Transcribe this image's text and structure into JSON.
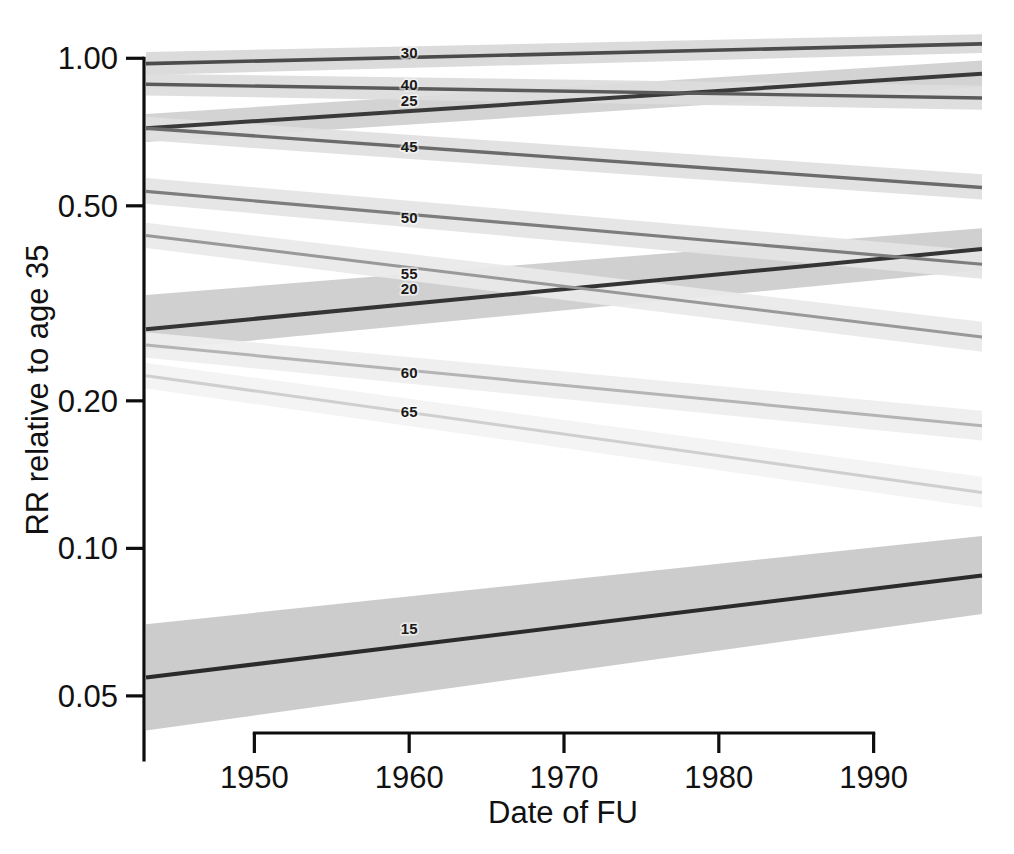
{
  "chart_data": {
    "type": "line",
    "title": "",
    "subtitle": "",
    "xlabel": "Date of FU",
    "ylabel": "RR relative to age 35",
    "yscale": "log",
    "xscale": "linear",
    "grid": false,
    "legend": "inline-labels",
    "xlim": [
      1943,
      1997
    ],
    "ylim": [
      0.042,
      1.1
    ],
    "xticks": [
      1950,
      1960,
      1970,
      1980,
      1990
    ],
    "xtick_labels": [
      "1950",
      "1960",
      "1970",
      "1980",
      "1990"
    ],
    "yticks": [
      0.05,
      0.1,
      0.2,
      0.5,
      1.0
    ],
    "ytick_labels": [
      "0.05",
      "0.10",
      "0.20",
      "0.50",
      "1.00"
    ],
    "x": [
      1943,
      1997
    ],
    "series": [
      {
        "name": "15",
        "label": "15",
        "label_x": 1960,
        "color": "#2b2b2b",
        "width": 4.0,
        "values": [
          0.0545,
          0.088
        ],
        "ci_lower": [
          0.0425,
          0.0735
        ],
        "ci_upper": [
          0.07,
          0.106
        ],
        "band_color": "#c8c8c8"
      },
      {
        "name": "20",
        "label": "20",
        "label_x": 1960,
        "color": "#343434",
        "width": 4.0,
        "values": [
          0.28,
          0.408
        ],
        "ci_lower": [
          0.253,
          0.37
        ],
        "ci_upper": [
          0.329,
          0.45
        ],
        "band_color": "#cccccc"
      },
      {
        "name": "25",
        "label": "25",
        "label_x": 1960,
        "color": "#3a3a3a",
        "width": 4.0,
        "values": [
          0.72,
          0.93
        ],
        "ci_lower": [
          0.675,
          0.875
        ],
        "ci_upper": [
          0.77,
          0.99
        ],
        "band_color": "#cfcfcf"
      },
      {
        "name": "30",
        "label": "30",
        "label_x": 1960,
        "color": "#4b4b4b",
        "width": 3.6,
        "values": [
          0.975,
          1.07
        ],
        "ci_lower": [
          0.925,
          1.025
        ],
        "ci_upper": [
          1.03,
          1.12
        ],
        "band_color": "#d8d8d8"
      },
      {
        "name": "40",
        "label": "40",
        "label_x": 1960,
        "color": "#5a5a5a",
        "width": 3.4,
        "values": [
          0.885,
          0.83
        ],
        "ci_lower": [
          0.84,
          0.785
        ],
        "ci_upper": [
          0.93,
          0.88
        ],
        "band_color": "#dcdcdc"
      },
      {
        "name": "45",
        "label": "45",
        "label_x": 1960,
        "color": "#6b6b6b",
        "width": 3.4,
        "values": [
          0.72,
          0.545
        ],
        "ci_lower": [
          0.68,
          0.515
        ],
        "ci_upper": [
          0.76,
          0.58
        ],
        "band_color": "#e0e0e0"
      },
      {
        "name": "50",
        "label": "50",
        "label_x": 1960,
        "color": "#7d7d7d",
        "width": 3.2,
        "values": [
          0.535,
          0.38
        ],
        "ci_lower": [
          0.505,
          0.355
        ],
        "ci_upper": [
          0.57,
          0.405
        ],
        "band_color": "#e4e4e4"
      },
      {
        "name": "55",
        "label": "55",
        "label_x": 1960,
        "color": "#999999",
        "width": 3.0,
        "values": [
          0.435,
          0.27
        ],
        "ci_lower": [
          0.41,
          0.252
        ],
        "ci_upper": [
          0.462,
          0.29
        ],
        "band_color": "#e9e9e9"
      },
      {
        "name": "60",
        "label": "60",
        "label_x": 1960,
        "color": "#b4b4b4",
        "width": 3.0,
        "values": [
          0.26,
          0.178
        ],
        "ci_lower": [
          0.245,
          0.166
        ],
        "ci_upper": [
          0.276,
          0.191
        ],
        "band_color": "#eeeeee"
      },
      {
        "name": "65",
        "label": "65",
        "label_x": 1960,
        "color": "#cfcfcf",
        "width": 3.0,
        "values": [
          0.225,
          0.13
        ],
        "ci_lower": [
          0.212,
          0.121
        ],
        "ci_upper": [
          0.239,
          0.14
        ],
        "band_color": "#f3f3f3"
      }
    ],
    "annotations": [
      {
        "text": "30",
        "x": 1960,
        "y": 1.002
      },
      {
        "text": "40",
        "x": 1960,
        "y": 0.862
      },
      {
        "text": "25",
        "x": 1960,
        "y": 0.8
      },
      {
        "text": "45",
        "x": 1960,
        "y": 0.643
      },
      {
        "text": "50",
        "x": 1960,
        "y": 0.461
      },
      {
        "text": "55",
        "x": 1960,
        "y": 0.354
      },
      {
        "text": "20",
        "x": 1960,
        "y": 0.33
      },
      {
        "text": "60",
        "x": 1960,
        "y": 0.223
      },
      {
        "text": "65",
        "x": 1960,
        "y": 0.185
      },
      {
        "text": "15",
        "x": 1960,
        "y": 0.067
      }
    ]
  },
  "axes": {
    "y_title": "RR relative to age 35",
    "x_title": "Date of FU"
  },
  "colors": {
    "axis": "#0d0d0d",
    "text": "#111111",
    "background": "#ffffff",
    "band_default": "#dddddd"
  },
  "geometry": {
    "plot_left": 146,
    "plot_right": 982,
    "plot_top": 38,
    "plot_bottom": 733,
    "axis_x": 144,
    "axis_y": 733
  }
}
